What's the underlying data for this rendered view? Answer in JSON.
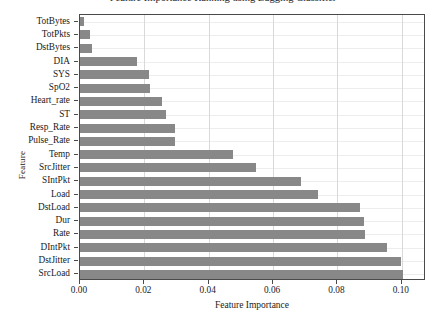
{
  "figure": {
    "title_cropped": "Feature Importance Ranking using Bagging Classifier",
    "axis": {
      "x_label": "Feature Importance",
      "y_label": "Feature",
      "x_ticks": [
        "0.00",
        "0.02",
        "0.04",
        "0.06",
        "0.08",
        "0.10"
      ],
      "x_min": 0,
      "x_max": 0.1075
    },
    "style": {
      "bar_color": "#888888",
      "grid_color": "#d9d9d9",
      "axis_color": "#4a4a4a",
      "background": "#ffffff"
    }
  },
  "chart_data": {
    "type": "bar",
    "orientation": "horizontal",
    "title": "Feature Importance Ranking using Bagging Classifier",
    "xlabel": "Feature Importance",
    "ylabel": "Feature",
    "xlim": [
      0,
      0.1075
    ],
    "grid": true,
    "legend": null,
    "categories": [
      "TotBytes",
      "TotPkts",
      "DstBytes",
      "DIA",
      "SYS",
      "SpO2",
      "Heart_rate",
      "ST",
      "Resp_Rate",
      "Pulse_Rate",
      "Temp",
      "SrcJitter",
      "SIntPkt",
      "Load",
      "DstLoad",
      "Dur",
      "Rate",
      "DIntPkt",
      "DstJitter",
      "SrcLoad"
    ],
    "values": [
      0.0012,
      0.003,
      0.0038,
      0.0178,
      0.0215,
      0.0219,
      0.0255,
      0.0266,
      0.0295,
      0.0296,
      0.0476,
      0.0548,
      0.0686,
      0.0739,
      0.087,
      0.0882,
      0.0885,
      0.0953,
      0.0996,
      0.1002
    ]
  }
}
